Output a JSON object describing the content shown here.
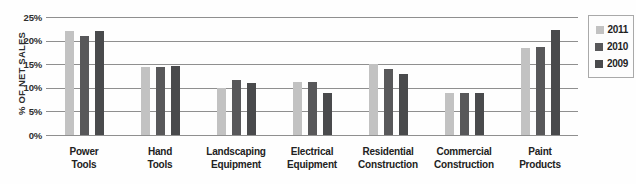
{
  "chart_data": {
    "type": "bar",
    "title": "",
    "xlabel": "",
    "ylabel": "% OF NET SALES",
    "ylim": [
      0,
      25
    ],
    "ytick_step": 5,
    "ytick_labels": [
      "25%",
      "20%",
      "15%",
      "10%",
      "5%",
      "0%"
    ],
    "grid": true,
    "legend_position": "right",
    "categories": [
      "Power Tools",
      "Hand Tools",
      "Landscaping Equipment",
      "Electrical Equipment",
      "Residential Construction",
      "Commercial Construction",
      "Paint Products"
    ],
    "category_label_lines": [
      [
        "Power",
        "Tools"
      ],
      [
        "Hand",
        "Tools"
      ],
      [
        "Landscaping",
        "Equipment"
      ],
      [
        "Electrical",
        "Equipment"
      ],
      [
        "Residential",
        "Construction"
      ],
      [
        "Commercial",
        "Construction"
      ],
      [
        "Paint",
        "Products"
      ]
    ],
    "series": [
      {
        "name": "2011",
        "color": "#c2c2c2",
        "values": [
          22,
          14.5,
          10,
          11.2,
          15,
          8.8,
          18.5
        ]
      },
      {
        "name": "2010",
        "color": "#58585a",
        "values": [
          21,
          14.5,
          11.7,
          11.3,
          14,
          8.9,
          18.7
        ]
      },
      {
        "name": "2009",
        "color": "#494a4c",
        "values": [
          22,
          14.6,
          11,
          9,
          13,
          8.8,
          22.3
        ]
      }
    ]
  },
  "colors": {
    "gridline": "#8f8f8f",
    "axis_text": "#2e2e2e",
    "legend_border": "#a9a9a9",
    "background": "#fefefe"
  }
}
